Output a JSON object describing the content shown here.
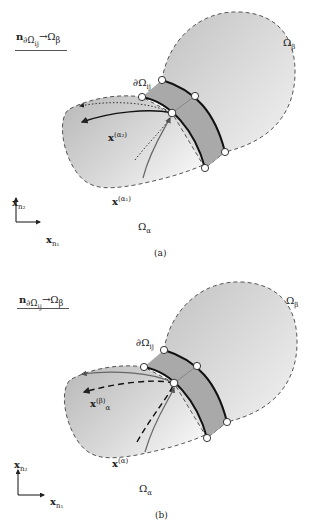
{
  "panels": [
    {
      "id": "a",
      "caption": "(a)",
      "header": {
        "vec": "n",
        "sub": "∂Ω",
        "subsub": "ij",
        "arrow": "→Ω",
        "target_sub": "β"
      },
      "labels": {
        "omega_beta": "Ω",
        "omega_beta_sub": "β",
        "boundary": "∂Ω",
        "boundary_sub": "ij",
        "omega_alpha": "Ω",
        "omega_alpha_sub": "α",
        "traj1": "x",
        "traj1_sup": "(α₁)",
        "traj2": "x",
        "traj2_sup": "(α₂)"
      },
      "axes": {
        "y": "x",
        "y_sub": "n₂",
        "x": "x",
        "x_sub": "n₁"
      }
    },
    {
      "id": "b",
      "caption": "(b)",
      "header": {
        "vec": "n",
        "sub": "∂Ω",
        "subsub": "ij",
        "arrow": "→Ω",
        "target_sub": "β"
      },
      "labels": {
        "omega_beta": "Ω",
        "omega_beta_sub": "β",
        "boundary": "∂Ω",
        "boundary_sub": "ij",
        "omega_alpha": "Ω",
        "omega_alpha_sub": "α",
        "traj1": "x",
        "traj1_sup": "(α)",
        "traj2": "x",
        "traj2_sub": "α",
        "traj2_sup": "(β)"
      },
      "axes": {
        "y": "x",
        "y_sub": "n₂",
        "x": "x",
        "x_sub": "n₁"
      }
    }
  ],
  "colors": {
    "domain_light": "#f4f4f4",
    "domain_dark": "#bdbdbd",
    "band": "#a8a8a8",
    "line": "#222222"
  }
}
